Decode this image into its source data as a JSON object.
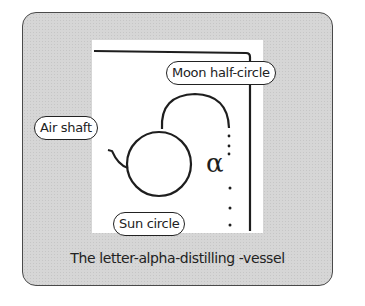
{
  "labels": {
    "moon": "Moon half-circle",
    "air": "Air shaft",
    "sun": "Sun circle",
    "alpha_glyph": "α"
  },
  "caption": "The letter-alpha-distilling -vessel",
  "colors": {
    "frame_bg": "#d6d6d6",
    "panel_bg": "#ffffff",
    "ink": "#222222"
  }
}
